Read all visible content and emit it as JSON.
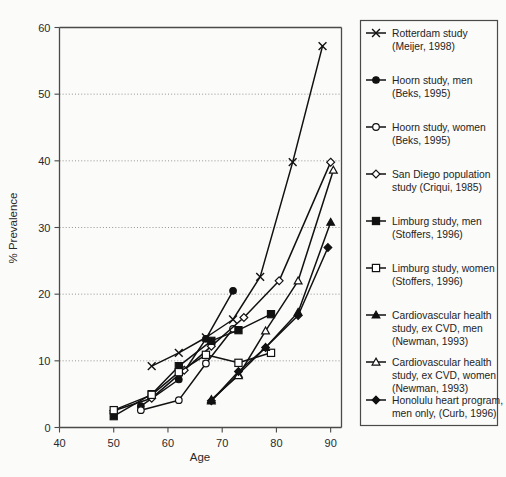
{
  "figure": {
    "kind": "scientific-line-chart",
    "background_color": "#fbfbfa",
    "ink_color": "#111111"
  },
  "axes": {
    "x_title": "Age",
    "y_title": "% Prevalence",
    "x_ticks": [
      "40",
      "50",
      "60",
      "70",
      "80",
      "90"
    ],
    "y_ticks": [
      "0",
      "10",
      "20",
      "30",
      "40",
      "50",
      "60"
    ],
    "x_min": 40,
    "x_max": 92,
    "y_min": 0,
    "y_max": 60,
    "grid": "horizontal-dotted"
  },
  "chart_data": {
    "type": "line",
    "title": "",
    "xlabel": "Age",
    "ylabel": "% Prevalence",
    "xlim": [
      40,
      92
    ],
    "ylim": [
      0,
      60
    ],
    "xticks": [
      40,
      50,
      60,
      70,
      80,
      90
    ],
    "yticks": [
      0,
      10,
      20,
      30,
      40,
      50,
      60
    ],
    "grid": true,
    "legend_position": "right-outside",
    "series": [
      {
        "name": "Rotterdam study (Meijer, 1998)",
        "marker": "cross",
        "x": [
          57,
          62,
          67,
          72,
          77,
          83,
          88.5
        ],
        "y": [
          9.2,
          11.2,
          13.5,
          16.2,
          22.6,
          39.8,
          57.2
        ]
      },
      {
        "name": "Hoorn study, men (Beks, 1995)",
        "marker": "filled-circle",
        "x": [
          55,
          62,
          67,
          72
        ],
        "y": [
          3.2,
          7.2,
          13.3,
          20.5
        ]
      },
      {
        "name": "Hoorn study, women (Beks, 1995)",
        "marker": "open-circle",
        "x": [
          55,
          62,
          67,
          72
        ],
        "y": [
          2.6,
          4.1,
          9.6,
          14.8
        ]
      },
      {
        "name": "San Diego population study (Criqui, 1985)",
        "marker": "open-diamond",
        "x": [
          50,
          57,
          63,
          68,
          74,
          80.5,
          90
        ],
        "y": [
          2.5,
          4.4,
          8.6,
          12.2,
          16.5,
          22.0,
          39.8
        ]
      },
      {
        "name": "Limburg study, men (Stoffers, 1996)",
        "marker": "filled-square",
        "x": [
          50,
          57,
          62,
          68,
          73,
          79
        ],
        "y": [
          1.7,
          5.0,
          9.2,
          13.0,
          14.6,
          17.0
        ]
      },
      {
        "name": "Limburg study, women (Stoffers, 1996)",
        "marker": "open-square",
        "x": [
          50,
          57,
          62,
          67,
          73,
          79
        ],
        "y": [
          2.6,
          4.9,
          8.3,
          10.9,
          9.7,
          11.2
        ]
      },
      {
        "name": "Cardiovascular health study, ex CVD, men (Newman, 1993)",
        "marker": "filled-triangle",
        "x": [
          68,
          73,
          78,
          84,
          90
        ],
        "y": [
          4.0,
          8.0,
          12.0,
          17.3,
          30.8
        ]
      },
      {
        "name": "Cardiovascular health study, ex CVD, women (Newman, 1993)",
        "marker": "open-triangle",
        "x": [
          68,
          73,
          78,
          84,
          90.5
        ],
        "y": [
          4.2,
          7.8,
          14.5,
          22.0,
          38.6
        ]
      },
      {
        "name": "Honolulu heart program, men only, (Curb, 1996)",
        "marker": "filled-diamond",
        "x": [
          68,
          73,
          78,
          84,
          89.5
        ],
        "y": [
          4.0,
          8.4,
          12.0,
          16.8,
          27.0
        ]
      }
    ]
  },
  "legend": {
    "entries": [
      {
        "marker": "cross",
        "line1": "Rotterdam study",
        "line2": "(Meijer, 1998)",
        "line3": ""
      },
      {
        "marker": "filled-circle",
        "line1": "Hoorn study, men",
        "line2": "(Beks, 1995)",
        "line3": ""
      },
      {
        "marker": "open-circle",
        "line1": "Hoorn study, women",
        "line2": "(Beks, 1995)",
        "line3": ""
      },
      {
        "marker": "open-diamond",
        "line1": "San Diego population",
        "line2": "study (Criqui, 1985)",
        "line3": ""
      },
      {
        "marker": "filled-square",
        "line1": "Limburg study, men",
        "line2": "(Stoffers, 1996)",
        "line3": ""
      },
      {
        "marker": "open-square",
        "line1": "Limburg study, women",
        "line2": "(Stoffers, 1996)",
        "line3": ""
      },
      {
        "marker": "filled-triangle",
        "line1": "Cardiovascular health",
        "line2": "study, ex CVD, men",
        "line3": "(Newman, 1993)"
      },
      {
        "marker": "open-triangle",
        "line1": "Cardiovascular health",
        "line2": "study, ex CVD, women",
        "line3": "(Newman, 1993)"
      },
      {
        "marker": "filled-diamond",
        "line1": "Honolulu heart program,",
        "line2": "men only, (Curb, 1996)",
        "line3": ""
      }
    ]
  }
}
